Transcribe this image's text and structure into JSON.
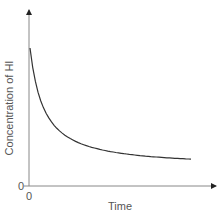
{
  "chart_data": {
    "type": "line",
    "title": "",
    "xlabel": "Time",
    "ylabel": "Concentration of HI",
    "x_origin_label": "0",
    "y_origin_label": "0",
    "grid": false,
    "legend": null,
    "series": [
      {
        "name": "HI concentration",
        "shape": "exponential decay",
        "x": [
          0,
          0.1,
          0.2,
          0.3,
          0.4,
          0.5,
          0.6,
          0.7,
          0.8,
          0.9,
          1.0
        ],
        "values": [
          1.0,
          0.62,
          0.45,
          0.35,
          0.29,
          0.24,
          0.21,
          0.19,
          0.17,
          0.155,
          0.14
        ]
      }
    ]
  }
}
